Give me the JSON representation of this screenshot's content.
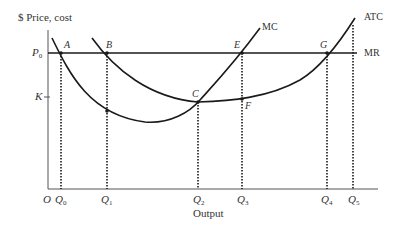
{
  "diagram": {
    "y_axis_label": "$ Price, cost",
    "x_axis_label": "Output",
    "origin_label": "O",
    "price_labels": [
      {
        "id": "P0",
        "main": "P",
        "sub": "0"
      },
      {
        "id": "K",
        "main": "K",
        "sub": ""
      }
    ],
    "quantity_labels": [
      {
        "id": "Q0",
        "main": "Q",
        "sub": "0"
      },
      {
        "id": "Q1",
        "main": "Q",
        "sub": "1"
      },
      {
        "id": "Q2",
        "main": "Q",
        "sub": "2"
      },
      {
        "id": "Q3",
        "main": "Q",
        "sub": "3"
      },
      {
        "id": "Q4",
        "main": "Q",
        "sub": "4"
      },
      {
        "id": "Q5",
        "main": "Q",
        "sub": "5"
      }
    ],
    "curve_labels": {
      "mc": "MC",
      "atc": "ATC",
      "mr": "MR"
    },
    "point_labels": {
      "A": "A",
      "B": "B",
      "C": "C",
      "E": "E",
      "F": "F",
      "G": "G"
    },
    "colors": {
      "line": "#1a1a1a",
      "text": "#333333",
      "background": "#ffffff"
    }
  }
}
